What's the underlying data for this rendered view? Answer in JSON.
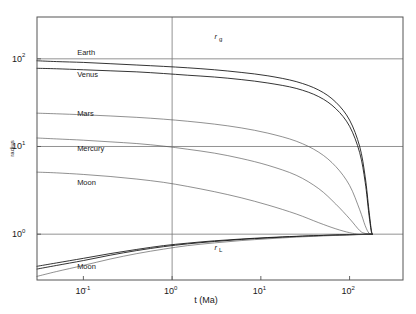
{
  "figure": {
    "background": "#ffffff",
    "frame_color": "#555555"
  },
  "chart_data": {
    "type": "line",
    "title": "",
    "subtitle": "",
    "xlabel": "t (Ma)",
    "ylabel": "radius",
    "grid": true,
    "legend_position": "inline-annotations",
    "xscale": "log",
    "yscale": "log",
    "xlim": [
      0.03,
      400
    ],
    "ylim": [
      0.3,
      300
    ],
    "xticks": [
      "10⁻¹",
      "10⁰",
      "10¹",
      "10²"
    ],
    "xtick_values": [
      0.1,
      1,
      10,
      100
    ],
    "yticks": [
      "10²",
      "10¹",
      "10⁰"
    ],
    "ytick_values": [
      100,
      10,
      1
    ],
    "annotations": [
      {
        "name": "r_g",
        "text": "r",
        "sub": "g",
        "x": 3.0,
        "y": 170
      },
      {
        "name": "r_L",
        "text": "r",
        "sub": "L",
        "x": 3.0,
        "y": 0.66
      }
    ],
    "series": [
      {
        "name": "Earth",
        "group": "rg",
        "label": "Earth",
        "label_x": 0.085,
        "label_y": 110,
        "color": "#111111",
        "points": [
          [
            0.03,
            95
          ],
          [
            0.05,
            93
          ],
          [
            0.1,
            91
          ],
          [
            0.2,
            88
          ],
          [
            0.4,
            85
          ],
          [
            0.8,
            82
          ],
          [
            1.5,
            79
          ],
          [
            3,
            75
          ],
          [
            6,
            70
          ],
          [
            12,
            64
          ],
          [
            25,
            55
          ],
          [
            45,
            44
          ],
          [
            70,
            32
          ],
          [
            100,
            20
          ],
          [
            130,
            10
          ],
          [
            150,
            4.5
          ],
          [
            165,
            1.9
          ],
          [
            175,
            1.15
          ],
          [
            180,
            1.0
          ]
        ]
      },
      {
        "name": "Venus",
        "group": "rg",
        "label": "Venus",
        "label_x": 0.085,
        "label_y": 62,
        "color": "#111111",
        "points": [
          [
            0.03,
            78
          ],
          [
            0.05,
            77
          ],
          [
            0.1,
            75
          ],
          [
            0.2,
            73
          ],
          [
            0.4,
            71
          ],
          [
            0.8,
            68
          ],
          [
            1.5,
            65
          ],
          [
            3,
            62
          ],
          [
            6,
            58
          ],
          [
            12,
            53
          ],
          [
            25,
            46
          ],
          [
            45,
            37
          ],
          [
            70,
            27
          ],
          [
            100,
            17
          ],
          [
            130,
            8.5
          ],
          [
            150,
            3.9
          ],
          [
            165,
            1.7
          ],
          [
            175,
            1.1
          ],
          [
            180,
            1.0
          ]
        ]
      },
      {
        "name": "Mars",
        "group": "rg",
        "label": "Mars",
        "label_x": 0.085,
        "label_y": 22,
        "color": "#555555",
        "points": [
          [
            0.03,
            24
          ],
          [
            0.05,
            23.6
          ],
          [
            0.1,
            23
          ],
          [
            0.2,
            22.3
          ],
          [
            0.4,
            21.5
          ],
          [
            0.8,
            20.5
          ],
          [
            1.5,
            19.4
          ],
          [
            3,
            18
          ],
          [
            6,
            16.3
          ],
          [
            12,
            14.2
          ],
          [
            25,
            11.5
          ],
          [
            45,
            8.6
          ],
          [
            70,
            5.9
          ],
          [
            100,
            3.6
          ],
          [
            130,
            1.9
          ],
          [
            150,
            1.25
          ],
          [
            165,
            1.03
          ],
          [
            180,
            1.0
          ]
        ]
      },
      {
        "name": "Mercury",
        "group": "rg",
        "label": "Mercury",
        "label_x": 0.085,
        "label_y": 9.0,
        "color": "#555555",
        "points": [
          [
            0.03,
            12.5
          ],
          [
            0.05,
            12.2
          ],
          [
            0.1,
            11.8
          ],
          [
            0.2,
            11.3
          ],
          [
            0.4,
            10.8
          ],
          [
            0.8,
            10.1
          ],
          [
            1.5,
            9.3
          ],
          [
            3,
            8.4
          ],
          [
            6,
            7.3
          ],
          [
            12,
            6.1
          ],
          [
            25,
            4.7
          ],
          [
            45,
            3.3
          ],
          [
            70,
            2.2
          ],
          [
            100,
            1.5
          ],
          [
            130,
            1.1
          ],
          [
            150,
            1.02
          ],
          [
            180,
            1.0
          ]
        ]
      },
      {
        "name": "Moon",
        "group": "rg",
        "label": "Moon",
        "label_x": 0.085,
        "label_y": 3.6,
        "color": "#777777",
        "points": [
          [
            0.03,
            5.1
          ],
          [
            0.05,
            5.0
          ],
          [
            0.1,
            4.8
          ],
          [
            0.2,
            4.55
          ],
          [
            0.4,
            4.25
          ],
          [
            0.8,
            3.9
          ],
          [
            1.5,
            3.5
          ],
          [
            3,
            3.05
          ],
          [
            6,
            2.6
          ],
          [
            12,
            2.15
          ],
          [
            25,
            1.7
          ],
          [
            45,
            1.35
          ],
          [
            70,
            1.15
          ],
          [
            100,
            1.04
          ],
          [
            130,
            1.0
          ],
          [
            180,
            1.0
          ]
        ]
      },
      {
        "name": "Earth-rL",
        "group": "rL",
        "label": "",
        "color": "#111111",
        "points": [
          [
            0.03,
            0.43
          ],
          [
            0.05,
            0.47
          ],
          [
            0.1,
            0.53
          ],
          [
            0.2,
            0.6
          ],
          [
            0.4,
            0.67
          ],
          [
            0.8,
            0.74
          ],
          [
            1.5,
            0.79
          ],
          [
            3,
            0.84
          ],
          [
            6,
            0.88
          ],
          [
            12,
            0.915
          ],
          [
            25,
            0.945
          ],
          [
            45,
            0.965
          ],
          [
            70,
            0.978
          ],
          [
            100,
            0.987
          ],
          [
            140,
            0.994
          ],
          [
            180,
            1.0
          ]
        ]
      },
      {
        "name": "Venus-rL",
        "group": "rL",
        "label": "",
        "color": "#111111",
        "points": [
          [
            0.03,
            0.4
          ],
          [
            0.05,
            0.44
          ],
          [
            0.1,
            0.5
          ],
          [
            0.2,
            0.575
          ],
          [
            0.4,
            0.65
          ],
          [
            0.8,
            0.72
          ],
          [
            1.5,
            0.775
          ],
          [
            3,
            0.825
          ],
          [
            6,
            0.87
          ],
          [
            12,
            0.905
          ],
          [
            25,
            0.94
          ],
          [
            45,
            0.962
          ],
          [
            70,
            0.976
          ],
          [
            100,
            0.986
          ],
          [
            140,
            0.993
          ],
          [
            180,
            1.0
          ]
        ]
      },
      {
        "name": "Moon-rL",
        "group": "rL",
        "label": "Moon",
        "label_x": 0.085,
        "label_y": 0.4,
        "color": "#777777",
        "points": [
          [
            0.03,
            0.33
          ],
          [
            0.05,
            0.375
          ],
          [
            0.1,
            0.44
          ],
          [
            0.2,
            0.52
          ],
          [
            0.4,
            0.6
          ],
          [
            0.8,
            0.675
          ],
          [
            1.5,
            0.74
          ],
          [
            3,
            0.795
          ],
          [
            6,
            0.845
          ],
          [
            12,
            0.885
          ],
          [
            25,
            0.925
          ],
          [
            45,
            0.95
          ],
          [
            70,
            0.968
          ],
          [
            100,
            0.981
          ],
          [
            140,
            0.991
          ],
          [
            180,
            1.0
          ]
        ]
      }
    ]
  }
}
